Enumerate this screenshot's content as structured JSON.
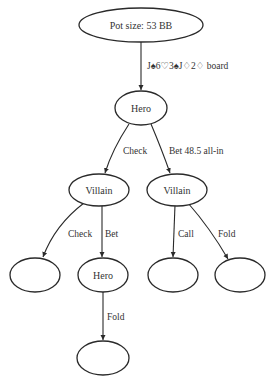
{
  "diagram": {
    "type": "game-tree",
    "root": {
      "label": "Pot size: 53 BB"
    },
    "nodes": {
      "root": {
        "label": "Pot size: 53 BB"
      },
      "hero": {
        "label": "Hero"
      },
      "villain_check": {
        "label": "Villain"
      },
      "villain_bet": {
        "label": "Villain"
      },
      "leaf_check_check": {
        "label": ""
      },
      "hero_facing_bet": {
        "label": "Hero"
      },
      "leaf_call": {
        "label": ""
      },
      "leaf_fold": {
        "label": ""
      },
      "leaf_hero_fold": {
        "label": ""
      }
    },
    "edges": {
      "root_to_hero": {
        "label": "J♠6♡3♠J♢2♢ board"
      },
      "hero_check": {
        "label": "Check"
      },
      "hero_bet": {
        "label": "Bet 48.5 all-in"
      },
      "villain_check": {
        "label": "Check"
      },
      "villain_bet": {
        "label": "Bet"
      },
      "villain_call": {
        "label": "Call"
      },
      "villain_fold": {
        "label": "Fold"
      },
      "hero_fold": {
        "label": "Fold"
      }
    },
    "colors": {
      "stroke": "#2a2a2a",
      "text": "#333333",
      "background": "#ffffff"
    }
  }
}
